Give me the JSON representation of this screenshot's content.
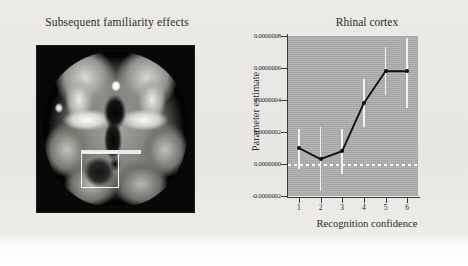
{
  "figure": {
    "left_panel": {
      "title": "Subsequent familiarity effects",
      "image_name": "axial-brain-slice",
      "roi_label": "rhinal-cortex-roi-box"
    },
    "right_panel": {
      "title": "Rhinal cortex"
    }
  },
  "chart_data": {
    "type": "line",
    "title": "Rhinal cortex",
    "xlabel": "Recognition confidence",
    "ylabel": "Parameter estimate",
    "x": [
      1,
      2,
      3,
      4,
      5,
      6
    ],
    "xticklabels": [
      "1",
      "2",
      "3",
      "4",
      "5",
      "6"
    ],
    "values": [
      1e-07,
      3e-08,
      8e-08,
      3.8e-07,
      5.8e-07,
      5.8e-07
    ],
    "errors_upper": [
      2.2e-07,
      2.3e-07,
      2.2e-07,
      5.3e-07,
      7.3e-07,
      7.9e-07
    ],
    "errors_lower": [
      -3e-08,
      -1.7e-07,
      -6e-08,
      2.3e-07,
      4.3e-07,
      3.5e-07
    ],
    "yticklabels": [
      "0.0000008",
      "0.0000006",
      "0.0000004",
      "0.0000002",
      "0.0000000",
      "-0.0000002"
    ],
    "ytickvalues": [
      8e-07,
      6e-07,
      4e-07,
      2e-07,
      0.0,
      -2e-07
    ],
    "ylim": [
      -2e-07,
      8e-07
    ],
    "xlim": [
      0.5,
      6.5
    ],
    "grid": false,
    "legend": null,
    "zero_reference_line": 0.0,
    "series_color": "#111111",
    "errorbar_color": "#f2f2f2",
    "plot_background": "#b0b0b0",
    "page_background": "#e9e8e4"
  }
}
